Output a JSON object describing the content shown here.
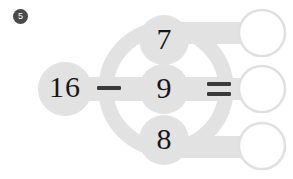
{
  "worksheet": {
    "problem_number": "5",
    "badge_style": "filled-dark-circle",
    "colors": {
      "connector_gray": "#e2e2e2",
      "answer_circle_stroke": "#e0e0e0",
      "answer_circle_fill": "#ffffff",
      "text": "#171717",
      "badge_bg": "#4a4a4a",
      "background": "#ffffff"
    }
  },
  "equation": {
    "minuend": "16",
    "operator_minus": "–",
    "operator_equals": "=",
    "subtrahends": [
      {
        "value": "7",
        "row": "top"
      },
      {
        "value": "9",
        "row": "middle"
      },
      {
        "value": "8",
        "row": "bottom"
      }
    ],
    "answers": [
      {
        "value": "",
        "row": "top"
      },
      {
        "value": "",
        "row": "middle"
      },
      {
        "value": "",
        "row": "bottom"
      }
    ]
  }
}
